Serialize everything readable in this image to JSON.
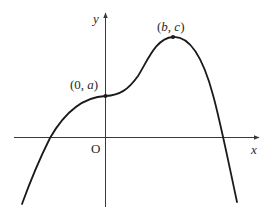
{
  "diagram": {
    "type": "function-graph",
    "axes": {
      "x_label": "x",
      "y_label": "y",
      "origin_label": "O"
    },
    "points": [
      {
        "name": "y-intercept",
        "label_open": "(0, ",
        "label_var": "a",
        "label_close": ")"
      },
      {
        "name": "maximum",
        "label_open": "(",
        "label_var1": "b",
        "label_sep": ", ",
        "label_var2": "c",
        "label_close": ")"
      }
    ],
    "curve": {
      "description": "Quartic-like curve rising from bottom-left, crossing negative x-axis, stationary point of inflection at (0, a), maximum at (b, c), then falling steeply crossing positive x-axis",
      "color": "#1a1a1a"
    },
    "colors": {
      "axis": "#3a3a3a",
      "curve": "#1a1a1a",
      "text": "#2a2a2a",
      "background": "#ffffff"
    }
  }
}
